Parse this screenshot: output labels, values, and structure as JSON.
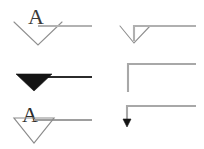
{
  "canvas": {
    "width": 204,
    "height": 149,
    "background": "#ffffff",
    "stroke_color": "#9a9a9a",
    "dark_stroke_color": "#2b2b2b",
    "fill_color": "#111111",
    "label_color": "#3a3a3a",
    "description": "Six line-ending / arrowhead style samples, each labelled with the letter A"
  },
  "samples": [
    {
      "id": "open-v-large-left",
      "label": "A",
      "row": 1,
      "column": 1,
      "arrowhead": "open-v-large",
      "filled": false,
      "line": "horizontal",
      "elbow": false,
      "label_x": 28,
      "label_y": 8,
      "label_size": 20
    },
    {
      "id": "open-v-elbow-right",
      "label": "A",
      "row": 1,
      "column": 2,
      "arrowhead": "open-v-small",
      "filled": false,
      "line": "elbow-down",
      "elbow": true,
      "label_x": 131,
      "label_y": 8,
      "label_size": 20
    },
    {
      "id": "solid-triangle-left",
      "label": "A",
      "row": 2,
      "column": 1,
      "arrowhead": "solid-triangle",
      "filled": true,
      "line": "horizontal",
      "elbow": false,
      "label_x": 22,
      "label_y": 56,
      "label_size": 20
    },
    {
      "id": "no-arrowhead-elbow-right",
      "label": "A",
      "row": 2,
      "column": 2,
      "arrowhead": "none",
      "filled": false,
      "line": "elbow-down",
      "elbow": true,
      "label_x": 104,
      "label_y": 58,
      "label_size": 20
    },
    {
      "id": "hollow-triangle-left",
      "label": "A",
      "row": 3,
      "column": 1,
      "arrowhead": "hollow-triangle",
      "filled": false,
      "line": "horizontal",
      "elbow": false,
      "label_x": 24,
      "label_y": 100,
      "label_size": 20
    },
    {
      "id": "small-solid-arrow-elbow-right",
      "label": "A",
      "row": 3,
      "column": 2,
      "arrowhead": "small-solid-arrow",
      "filled": true,
      "line": "elbow-down",
      "elbow": true,
      "label_x": 103,
      "label_y": 100,
      "label_size": 20
    }
  ]
}
